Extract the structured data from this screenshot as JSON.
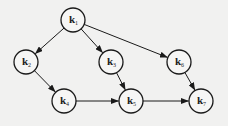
{
  "diagram": {
    "type": "directed-acyclic-graph",
    "colors": {
      "background": "#f1f1f0",
      "stroke": "#1a1a1a",
      "node_fill": "#f6f6f5",
      "text": "#222222"
    },
    "node_radius": 12,
    "nodes": [
      {
        "id": "k1",
        "letter": "k",
        "sub": "1",
        "x": 73,
        "y": 20
      },
      {
        "id": "k2",
        "letter": "k",
        "sub": "2",
        "x": 26,
        "y": 62
      },
      {
        "id": "k3",
        "letter": "k",
        "sub": "3",
        "x": 111,
        "y": 62
      },
      {
        "id": "k6",
        "letter": "k",
        "sub": "6",
        "x": 179,
        "y": 62
      },
      {
        "id": "k4",
        "letter": "k",
        "sub": "4",
        "x": 64,
        "y": 101
      },
      {
        "id": "k5",
        "letter": "k",
        "sub": "5",
        "x": 131,
        "y": 101
      },
      {
        "id": "k7",
        "letter": "k",
        "sub": "7",
        "x": 201,
        "y": 101
      }
    ],
    "edges": [
      {
        "from": "k1",
        "to": "k2"
      },
      {
        "from": "k1",
        "to": "k3"
      },
      {
        "from": "k1",
        "to": "k6"
      },
      {
        "from": "k2",
        "to": "k4"
      },
      {
        "from": "k3",
        "to": "k5"
      },
      {
        "from": "k6",
        "to": "k7"
      },
      {
        "from": "k4",
        "to": "k5"
      },
      {
        "from": "k5",
        "to": "k7"
      }
    ]
  }
}
